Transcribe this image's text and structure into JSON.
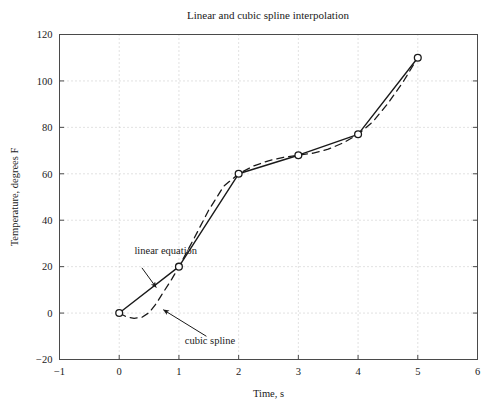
{
  "chart_data": {
    "type": "line",
    "title": "Linear and cubic spline interpolation",
    "xlabel": "Time, s",
    "ylabel": "Temperature, degrees F",
    "xlim": [
      -1,
      6
    ],
    "ylim": [
      -20,
      120
    ],
    "xticks": [
      "−1",
      "0",
      "1",
      "2",
      "3",
      "4",
      "5",
      "6"
    ],
    "xtick_values": [
      -1,
      0,
      1,
      2,
      3,
      4,
      5,
      6
    ],
    "yticks": [
      "−20",
      "0",
      "20",
      "40",
      "60",
      "80",
      "100",
      "120"
    ],
    "ytick_values": [
      -20,
      0,
      20,
      40,
      60,
      80,
      100,
      120
    ],
    "grid": true,
    "grid_style": "dotted",
    "legend": "none",
    "x": [
      0,
      1,
      2,
      3,
      4,
      5
    ],
    "series": [
      {
        "name": "linear equation",
        "style": "solid",
        "marker": "circle",
        "values": [
          0,
          20,
          60,
          68,
          77,
          110
        ]
      },
      {
        "name": "cubic spline",
        "style": "dashed",
        "marker": "none",
        "values": [
          0,
          20,
          60,
          68,
          77,
          110
        ],
        "sampled_x": [
          0,
          0.12,
          0.25,
          0.38,
          0.5,
          0.62,
          0.75,
          0.88,
          1,
          1.25,
          1.5,
          1.75,
          2,
          2.25,
          2.5,
          2.75,
          3,
          3.25,
          3.5,
          3.75,
          4,
          4.25,
          4.5,
          4.75,
          5
        ],
        "sampled_y": [
          0,
          -1.6,
          -2.3,
          -1.8,
          0.2,
          4.1,
          9.4,
          14.6,
          20,
          32.0,
          44.4,
          54.6,
          60,
          63.4,
          65.6,
          67.1,
          68,
          68.9,
          70.6,
          73.3,
          77,
          82.5,
          90.3,
          99.4,
          110
        ]
      }
    ],
    "annotations": [
      {
        "name": "linear equation",
        "label": "linear equation",
        "label_x": 0.78,
        "label_y": 25.5,
        "arrow_from_x": 0.38,
        "arrow_from_y": 19.5,
        "arrow_to_x": 0.62,
        "arrow_to_y": 11.0
      },
      {
        "name": "cubic spline",
        "label": "cubic spline",
        "label_x": 1.52,
        "label_y": -13.5,
        "arrow_from_x": 1.46,
        "arrow_from_y": -10.0,
        "arrow_to_x": 0.74,
        "arrow_to_y": 1.4
      }
    ]
  },
  "colors": {
    "line": "#1a1a1a",
    "grid": "#bdbdbd",
    "axis": "#4a4a4a",
    "background": "#ffffff",
    "text": "#1a1a1a"
  }
}
